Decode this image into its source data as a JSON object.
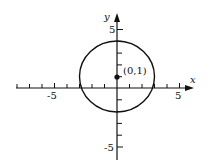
{
  "diagram": {
    "type": "coordinate-plane-circle",
    "axes": {
      "x_label": "x",
      "y_label": "y",
      "x_range": [
        -8,
        6
      ],
      "y_range": [
        -6,
        6
      ],
      "x_tick_labels": [
        {
          "value": -5,
          "text": "-5"
        },
        {
          "value": 5,
          "text": "5"
        }
      ],
      "y_tick_labels": [
        {
          "value": 5,
          "text": "5"
        },
        {
          "value": -5,
          "text": "-5"
        }
      ]
    },
    "circle": {
      "center": [
        0,
        1
      ],
      "radius": 3,
      "equation": "x^2 + (y-1)^2 = 9"
    },
    "point": {
      "coords": [
        0,
        1
      ],
      "label": "(0,1)"
    },
    "colors": {
      "stroke": "#111111",
      "background": "#ffffff"
    }
  }
}
